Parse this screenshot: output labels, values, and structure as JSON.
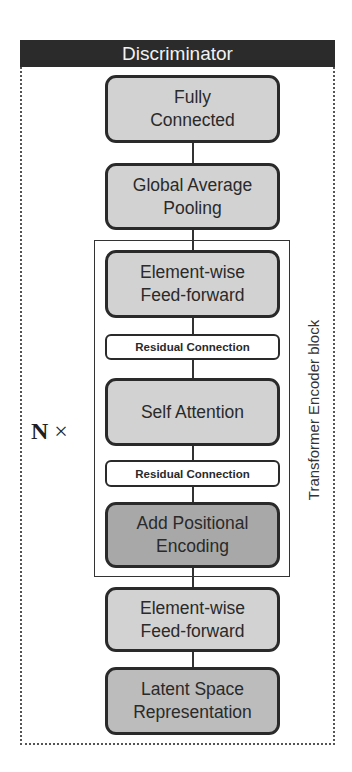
{
  "diagram": {
    "title": "Discriminator",
    "repeat_label": {
      "n": "N",
      "times": "×"
    },
    "encoder_block_label": "Transformer Encoder block",
    "blocks": [
      {
        "id": "fully-connected",
        "label": "Fully\nConnected",
        "style": "light"
      },
      {
        "id": "global-average-pooling",
        "label": "Global Average\nPooling",
        "style": "light"
      },
      {
        "id": "element-wise-ff-1",
        "label": "Element-wise\nFeed-forward",
        "style": "light",
        "in_encoder": true
      },
      {
        "id": "residual-1",
        "label": "Residual Connection",
        "style": "white",
        "in_encoder": true
      },
      {
        "id": "self-attention",
        "label": "Self Attention",
        "style": "light",
        "in_encoder": true
      },
      {
        "id": "residual-2",
        "label": "Residual Connection",
        "style": "white",
        "in_encoder": true
      },
      {
        "id": "add-positional-encoding",
        "label": "Add Positional\nEncoding",
        "style": "dark",
        "in_encoder": true
      },
      {
        "id": "element-wise-ff-2",
        "label": "Element-wise\nFeed-forward",
        "style": "light"
      },
      {
        "id": "latent-space",
        "label": "Latent Space\nRepresentation",
        "style": "mid"
      }
    ],
    "colors": {
      "header_bg": "#2b2b2b",
      "light_box": "#d2d2d2",
      "dark_box": "#a8a8a8",
      "mid_box": "#bcbcbc",
      "residual_box": "#ffffff",
      "border": "#2a2a2a"
    }
  }
}
